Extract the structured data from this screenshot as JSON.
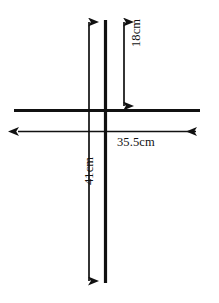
{
  "figure": {
    "type": "geometry-dimension-diagram",
    "background_color": "#ffffff",
    "stroke_color": "#111111",
    "canvas": {
      "width": 219,
      "height": 303
    }
  },
  "lines": [
    {
      "name": "horizontal-line",
      "orientation": "horizontal",
      "x1": 14,
      "y1": 110,
      "x2": 200,
      "y2": 110,
      "stroke_width": 3.2,
      "arrowheads": "none"
    },
    {
      "name": "vertical-line",
      "orientation": "vertical",
      "x1": 105,
      "y1": 20,
      "x2": 105,
      "y2": 283,
      "stroke_width": 3.2,
      "arrowheads": "none"
    }
  ],
  "dimensions": [
    {
      "name": "dimension-18cm",
      "label": "18cm",
      "value": 18,
      "unit": "cm",
      "orientation": "vertical",
      "arrowheads": "both",
      "x1": 124,
      "y1": 18,
      "x2": 124,
      "y2": 110,
      "stroke_width": 1.6,
      "label_rotation_deg": -90
    },
    {
      "name": "dimension-35-5cm",
      "label": "35.5cm",
      "value": 35.5,
      "unit": "cm",
      "orientation": "horizontal",
      "arrowheads": "both",
      "x1": 14,
      "y1": 131,
      "x2": 200,
      "y2": 131,
      "stroke_width": 1.6,
      "label_rotation_deg": 0
    },
    {
      "name": "dimension-41cm",
      "label": "41cm",
      "value": 41,
      "unit": "cm",
      "orientation": "vertical",
      "arrowheads": "both",
      "x1": 89,
      "y1": 18,
      "x2": 89,
      "y2": 285,
      "stroke_width": 1.6,
      "label_rotation_deg": -90
    }
  ],
  "intersection": {
    "x": 105,
    "y": 110
  }
}
